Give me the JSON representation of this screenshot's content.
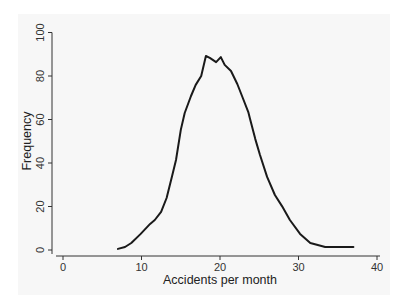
{
  "chart_data": {
    "type": "line",
    "title": "",
    "xlabel": "Accidents per month",
    "ylabel": "Frequency",
    "xlim": [
      0,
      40
    ],
    "ylim": [
      0,
      100
    ],
    "xticks": [
      0,
      10,
      20,
      30,
      40
    ],
    "yticks": [
      0,
      20,
      40,
      60,
      80,
      100
    ],
    "grid": false,
    "legend": null,
    "series": [
      {
        "name": "Frequency",
        "color": "#1a1a1a",
        "x": [
          7.0,
          7.9,
          8.7,
          9.9,
          11.1,
          11.7,
          12.5,
          13.2,
          13.9,
          14.4,
          15.0,
          15.5,
          16.3,
          16.9,
          17.6,
          18.2,
          18.7,
          19.5,
          20.1,
          20.6,
          21.4,
          22.2,
          22.9,
          23.6,
          23.8,
          24.5,
          25.1,
          26.0,
          27.0,
          27.9,
          28.9,
          30.2,
          31.5,
          33.4,
          37.0
        ],
        "y": [
          0.5,
          1.4,
          3.2,
          7.4,
          12.0,
          13.8,
          17.5,
          23.9,
          34.0,
          41.4,
          55.2,
          63.0,
          70.8,
          75.9,
          80.0,
          89.2,
          88.3,
          86.4,
          88.7,
          85.1,
          82.3,
          76.3,
          69.9,
          63.4,
          60.7,
          51.0,
          43.7,
          33.6,
          25.3,
          20.2,
          13.8,
          7.4,
          3.2,
          1.4,
          1.4
        ]
      }
    ]
  },
  "axes": {
    "x_title": "Accidents per month",
    "y_title": "Frequency",
    "x_tick_labels": [
      "0",
      "10",
      "20",
      "30",
      "40"
    ],
    "y_tick_labels": [
      "0",
      "20",
      "40",
      "60",
      "80",
      "100"
    ]
  }
}
